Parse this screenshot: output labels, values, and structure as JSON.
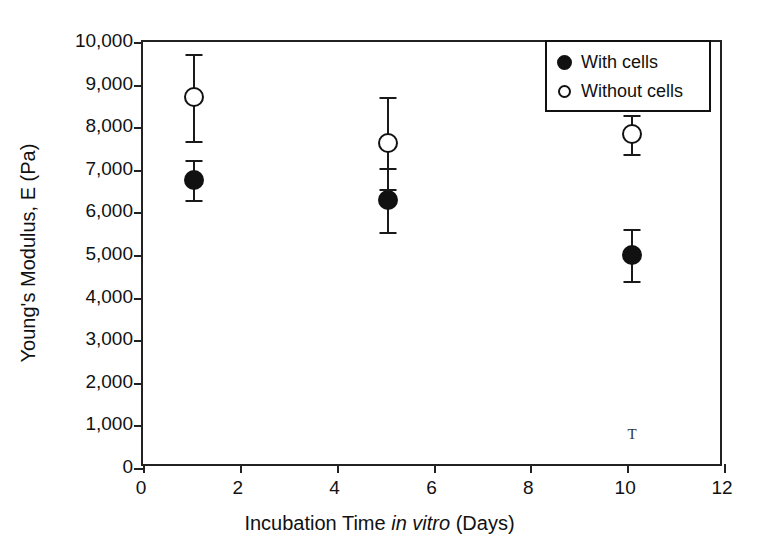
{
  "chart_data": {
    "type": "scatter",
    "title": "",
    "xlabel": "Incubation Time in vitro (Days)",
    "xlabel_parts": {
      "pre": "Incubation Time ",
      "italic": "in vitro",
      "post": " (Days)"
    },
    "ylabel": "Young's Modulus, E (Pa)",
    "xlim": [
      0,
      12
    ],
    "ylim": [
      0,
      10000
    ],
    "xticks": [
      0,
      2,
      4,
      6,
      8,
      10,
      12
    ],
    "xtick_labels": [
      "0",
      "2",
      "4",
      "6",
      "8",
      "10",
      "12"
    ],
    "yticks": [
      0,
      1000,
      2000,
      3000,
      4000,
      5000,
      6000,
      7000,
      8000,
      9000,
      10000
    ],
    "ytick_labels": [
      "0",
      "1,000",
      "2,000",
      "3,000",
      "4,000",
      "5,000",
      "6,000",
      "7,000",
      "8,000",
      "9,000",
      "10,000"
    ],
    "grid": false,
    "legend_position": "top-right",
    "error_bars": "symmetric",
    "series": [
      {
        "name": "With cells",
        "marker": "filled-circle",
        "color": "#111111",
        "x": [
          1.05,
          5.05,
          10.1
        ],
        "values": [
          6750,
          6300,
          5000
        ],
        "errors": [
          470,
          750,
          600
        ]
      },
      {
        "name": "Without cells",
        "marker": "open-circle",
        "color": "#111111",
        "x": [
          1.05,
          5.05,
          10.1
        ],
        "values": [
          8700,
          7630,
          7830
        ],
        "errors": [
          1030,
          1080,
          450
        ]
      }
    ],
    "annotations": [
      {
        "name": "stray-error-cap",
        "glyph": "T",
        "x": 10.1,
        "y": 800
      }
    ]
  },
  "legend": {
    "items": [
      {
        "label": "With cells",
        "marker": "filled-circle"
      },
      {
        "label": "Without cells",
        "marker": "open-circle"
      }
    ]
  }
}
